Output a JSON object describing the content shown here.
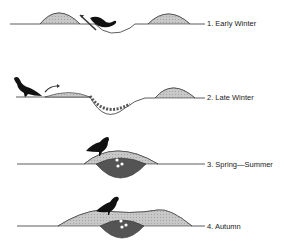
{
  "figure": {
    "panels": [
      {
        "id": "early-winter",
        "label": "1. Early Winter"
      },
      {
        "id": "late-winter",
        "label": "2. Late Winter"
      },
      {
        "id": "spring-summer",
        "label": "3. Spring—Summer"
      },
      {
        "id": "autumn",
        "label": "4. Autumn"
      }
    ],
    "colors": {
      "line": "#333333",
      "mound": "#c8c8c8",
      "chamber": "#5a5a5a",
      "bird": "#111111",
      "eggs": "#ffffff"
    }
  }
}
